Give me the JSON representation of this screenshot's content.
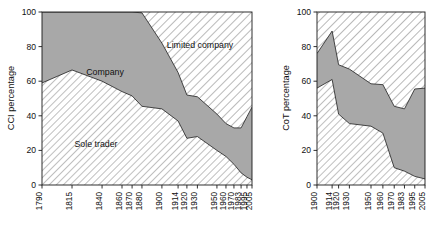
{
  "figure": {
    "background": "#ffffff",
    "width": 437,
    "height": 234
  },
  "style": {
    "sole_trader_fill": "#f2f2f2",
    "company_fill": "#a8a8a8",
    "limited_company_fill": "#ffffff",
    "hatch_color": "#7a7a7a",
    "line_color": "#2b2b2b",
    "text_color": "#111111"
  },
  "labels": {
    "sole_trader": "Sole trader",
    "company": "Company",
    "limited_company": "Limited company"
  },
  "chart_data": [
    {
      "type": "area",
      "id": "cci",
      "title": "",
      "xlabel": "",
      "ylabel": "CCI percentage",
      "ylim": [
        0,
        100
      ],
      "yticks": [
        0,
        20,
        40,
        60,
        80,
        100
      ],
      "ytick_labels": [
        "0",
        "20",
        "40",
        "60",
        "80",
        "100"
      ],
      "grid": false,
      "legend": "inline-annotations",
      "stacked": true,
      "categories": [
        "1790",
        "1815",
        "1840",
        "1860",
        "1870",
        "1880",
        "1900",
        "1914",
        "1920",
        "1930",
        "1950",
        "1960",
        "1970",
        "1983",
        "1995",
        "2005"
      ],
      "series": [
        {
          "name": "Sole trader",
          "values": [
            59,
            66.5,
            60,
            54,
            51.5,
            45.5,
            44,
            37,
            27,
            28,
            20,
            16.5,
            12,
            7,
            4.5,
            3
          ]
        },
        {
          "name": "Company",
          "values": [
            41,
            33.5,
            40,
            46,
            48.5,
            54,
            38,
            28,
            25,
            23,
            21,
            19,
            21,
            26,
            35,
            42
          ]
        },
        {
          "name": "Limited company",
          "values": [
            0,
            0,
            0,
            0,
            0,
            0.5,
            18,
            35,
            48,
            49,
            59,
            64.5,
            67,
            67,
            60.5,
            55
          ]
        }
      ],
      "cumulative_top_sole_trader": [
        59,
        66.5,
        60,
        54,
        51.5,
        45.5,
        44,
        37,
        27,
        28,
        20,
        16.5,
        12,
        7,
        4.5,
        3
      ],
      "cumulative_top_company": [
        100,
        100,
        100,
        100,
        100,
        99.5,
        82,
        65,
        52,
        51,
        41,
        35.5,
        33,
        33,
        39.5,
        45
      ]
    },
    {
      "type": "area",
      "id": "cot",
      "title": "",
      "xlabel": "",
      "ylabel": "CoT percentage",
      "ylim": [
        0,
        100
      ],
      "yticks": [
        0,
        20,
        40,
        60,
        80,
        100
      ],
      "ytick_labels": [
        "0",
        "20",
        "40",
        "60",
        "80",
        "100"
      ],
      "grid": false,
      "legend": "none",
      "stacked": true,
      "categories": [
        "1900",
        "1914",
        "1920",
        "1930",
        "1950",
        "1960",
        "1970",
        "1983",
        "1995",
        "2005"
      ],
      "series": [
        {
          "name": "Sole trader",
          "values": [
            56,
            61,
            41,
            35.5,
            34,
            30,
            10,
            8,
            5,
            3.5
          ]
        },
        {
          "name": "Company",
          "values": [
            20,
            28,
            28.5,
            31.5,
            24.5,
            28,
            35.5,
            36,
            50.5,
            52.5
          ]
        },
        {
          "name": "Limited company",
          "values": [
            24,
            11,
            30.5,
            33,
            41.5,
            42,
            54.5,
            56,
            44.5,
            44
          ]
        }
      ],
      "cumulative_top_sole_trader": [
        56,
        61,
        41,
        35.5,
        34,
        30,
        10,
        8,
        5,
        3.5
      ],
      "cumulative_top_company": [
        76,
        89,
        69.5,
        67,
        58.5,
        58,
        45.5,
        44,
        55.5,
        56
      ]
    }
  ]
}
